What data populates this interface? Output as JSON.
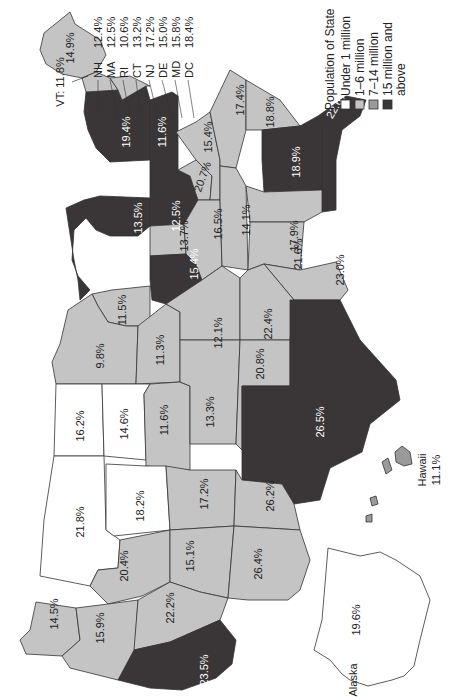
{
  "colors": {
    "under_1m": "#ffffff",
    "1_6m": "#c4c4c4",
    "7_14m": "#9a9a9a",
    "15m_above": "#3a3536",
    "border": "#333333",
    "text_dark": "#222222",
    "text_light": "#ffffff"
  },
  "legend": {
    "title": "Population of State",
    "items": [
      {
        "label": "Under 1 million",
        "color": "#ffffff"
      },
      {
        "label": "1–6 million",
        "color": "#c4c4c4"
      },
      {
        "label": "7–14 million",
        "color": "#9a9a9a"
      },
      {
        "label": "15 million and",
        "label2": "above",
        "color": "#3a3536"
      }
    ]
  },
  "callouts": {
    "vt": "VT: 11.8%",
    "list": [
      {
        "state": "NH",
        "value": "12.4%"
      },
      {
        "state": "MA",
        "value": "12.5%"
      },
      {
        "state": "RI",
        "value": "10.6%"
      },
      {
        "state": "CT",
        "value": "13.2%"
      },
      {
        "state": "NJ",
        "value": "17.2%"
      },
      {
        "state": "DE",
        "value": "15.0%"
      },
      {
        "state": "MD",
        "value": "15.8%"
      },
      {
        "state": "DC",
        "value": "18.4%"
      }
    ]
  },
  "states": [
    {
      "id": "ME",
      "value": "14.9%",
      "cls": "1_6m"
    },
    {
      "id": "NY",
      "value": "19.4%",
      "cls": "15m_above"
    },
    {
      "id": "PA",
      "value": "11.6%",
      "cls": "15m_above"
    },
    {
      "id": "OH",
      "value": "12.5%",
      "cls": "15m_above"
    },
    {
      "id": "MI",
      "value": "13.5%",
      "cls": "15m_above"
    },
    {
      "id": "WV",
      "value": "20.7%",
      "cls": "1_6m"
    },
    {
      "id": "VA",
      "value": "15.4%",
      "cls": "1_6m"
    },
    {
      "id": "NC",
      "value": "17.4%",
      "cls": "1_6m"
    },
    {
      "id": "SC",
      "value": "18.8%",
      "cls": "1_6m"
    },
    {
      "id": "GA",
      "value": "18.9%",
      "cls": "15m_above"
    },
    {
      "id": "FL",
      "value": "22.6%",
      "cls": "15m_above"
    },
    {
      "id": "IN",
      "value": "13.7%",
      "cls": "1_6m"
    },
    {
      "id": "KY",
      "value": "16.5%",
      "cls": "1_6m"
    },
    {
      "id": "TN",
      "value": "14.1%",
      "cls": "1_6m"
    },
    {
      "id": "AL",
      "value": "17.9%",
      "cls": "1_6m"
    },
    {
      "id": "MS",
      "value": "21.6%",
      "cls": "1_6m"
    },
    {
      "id": "LA",
      "value": "23.0%",
      "cls": "1_6m"
    },
    {
      "id": "IL",
      "value": "15.4%",
      "cls": "15m_above"
    },
    {
      "id": "WI",
      "value": "11.5%",
      "cls": "1_6m"
    },
    {
      "id": "MN",
      "value": "9.8%",
      "cls": "1_6m"
    },
    {
      "id": "IA",
      "value": "11.3%",
      "cls": "1_6m"
    },
    {
      "id": "MO",
      "value": "12.1%",
      "cls": "1_6m"
    },
    {
      "id": "AR",
      "value": "22.4%",
      "cls": "1_6m"
    },
    {
      "id": "ND",
      "value": "16.2%",
      "cls": "under_1m"
    },
    {
      "id": "SD",
      "value": "14.6%",
      "cls": "under_1m"
    },
    {
      "id": "NE",
      "value": "11.6%",
      "cls": "1_6m"
    },
    {
      "id": "KS",
      "value": "13.3%",
      "cls": "1_6m"
    },
    {
      "id": "OK",
      "value": "20.8%",
      "cls": "1_6m"
    },
    {
      "id": "TX",
      "value": "26.5%",
      "cls": "15m_above"
    },
    {
      "id": "MT",
      "value": "21.8%",
      "cls": "under_1m"
    },
    {
      "id": "WY",
      "value": "18.2%",
      "cls": "under_1m"
    },
    {
      "id": "CO",
      "value": "17.2%",
      "cls": "1_6m"
    },
    {
      "id": "NM",
      "value": "26.2%",
      "cls": "1_6m"
    },
    {
      "id": "ID",
      "value": "20.4%",
      "cls": "1_6m"
    },
    {
      "id": "UT",
      "value": "15.1%",
      "cls": "1_6m"
    },
    {
      "id": "AZ",
      "value": "26.4%",
      "cls": "1_6m"
    },
    {
      "id": "WA",
      "value": "14.5%",
      "cls": "1_6m"
    },
    {
      "id": "OR",
      "value": "15.9%",
      "cls": "1_6m"
    },
    {
      "id": "NV",
      "value": "22.2%",
      "cls": "1_6m"
    },
    {
      "id": "CA",
      "value": "23.5%",
      "cls": "15m_above"
    }
  ],
  "insets": {
    "alaska": {
      "label": "Alaska",
      "value": "19.6%"
    },
    "hawaii": {
      "label": "Hawaii",
      "value": "11.1%"
    }
  }
}
